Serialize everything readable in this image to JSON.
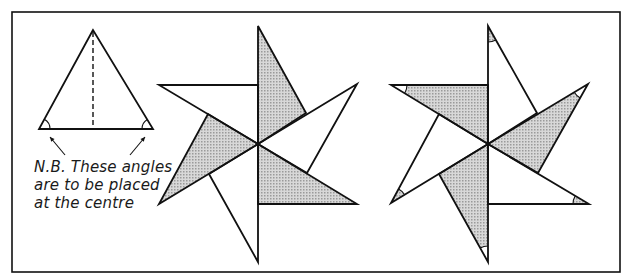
{
  "figure": {
    "frame": {
      "x": 12,
      "y": 12,
      "width": 608,
      "height": 260
    },
    "colors": {
      "stroke": "#111111",
      "shade": "#c9c9c9",
      "background": "#ffffff"
    },
    "template_triangle": {
      "apex": [
        93,
        30
      ],
      "base_left": [
        39,
        129
      ],
      "base_right": [
        153,
        129
      ],
      "dashed_axis": {
        "from": [
          93,
          32
        ],
        "to": [
          93,
          129
        ]
      },
      "marked_angles": [
        "base_left",
        "base_right"
      ]
    },
    "note": {
      "lines": [
        "N.B. These angles",
        "are to be placed",
        "at the centre"
      ],
      "arrows": [
        {
          "from": [
            65,
            155
          ],
          "to": [
            50,
            137
          ]
        },
        {
          "from": [
            130,
            155
          ],
          "to": [
            145,
            137
          ]
        }
      ]
    },
    "stars": [
      {
        "name": "pinwheel-star-left",
        "center": [
          258,
          144
        ],
        "blades": [
          {
            "points": [
              [
                258,
                144
              ],
              [
                258,
                26
              ],
              [
                306,
                113
              ]
            ],
            "shaded": true
          },
          {
            "points": [
              [
                258,
                144
              ],
              [
                357,
                84
              ],
              [
                307,
                173
              ]
            ],
            "shaded": false
          },
          {
            "points": [
              [
                258,
                144
              ],
              [
                357,
                204
              ],
              [
                258,
                204
              ]
            ],
            "shaded": true
          },
          {
            "points": [
              [
                258,
                144
              ],
              [
                258,
                262
              ],
              [
                209,
                174
              ]
            ],
            "shaded": false
          },
          {
            "points": [
              [
                258,
                144
              ],
              [
                159,
                204
              ],
              [
                208,
                114
              ]
            ],
            "shaded": true
          },
          {
            "points": [
              [
                258,
                144
              ],
              [
                159,
                85
              ],
              [
                258,
                85
              ]
            ],
            "shaded": false
          }
        ]
      },
      {
        "name": "pinwheel-star-right",
        "center": [
          488,
          144
        ],
        "blades": [
          {
            "points": [
              [
                488,
                144
              ],
              [
                488,
                26
              ],
              [
                537,
                113
              ]
            ],
            "shaded": false,
            "tip_arc": [
              488,
              26
            ],
            "arc_shaded": true
          },
          {
            "points": [
              [
                488,
                144
              ],
              [
                588,
                84
              ],
              [
                538,
                173
              ]
            ],
            "shaded": true,
            "tip_arc": [
              588,
              84
            ],
            "arc_shaded": false
          },
          {
            "points": [
              [
                488,
                144
              ],
              [
                589,
                204
              ],
              [
                488,
                204
              ]
            ],
            "shaded": false,
            "tip_arc": [
              589,
              204
            ],
            "arc_shaded": true
          },
          {
            "points": [
              [
                488,
                144
              ],
              [
                488,
                262
              ],
              [
                439,
                174
              ]
            ],
            "shaded": true,
            "tip_arc": [
              488,
              262
            ],
            "arc_shaded": false
          },
          {
            "points": [
              [
                488,
                144
              ],
              [
                391,
                203
              ],
              [
                439,
                114
              ]
            ],
            "shaded": false,
            "tip_arc": [
              391,
              203
            ],
            "arc_shaded": true
          },
          {
            "points": [
              [
                488,
                144
              ],
              [
                391,
                85
              ],
              [
                488,
                85
              ]
            ],
            "shaded": true,
            "tip_arc": [
              391,
              85
            ],
            "arc_shaded": false
          }
        ]
      }
    ]
  }
}
